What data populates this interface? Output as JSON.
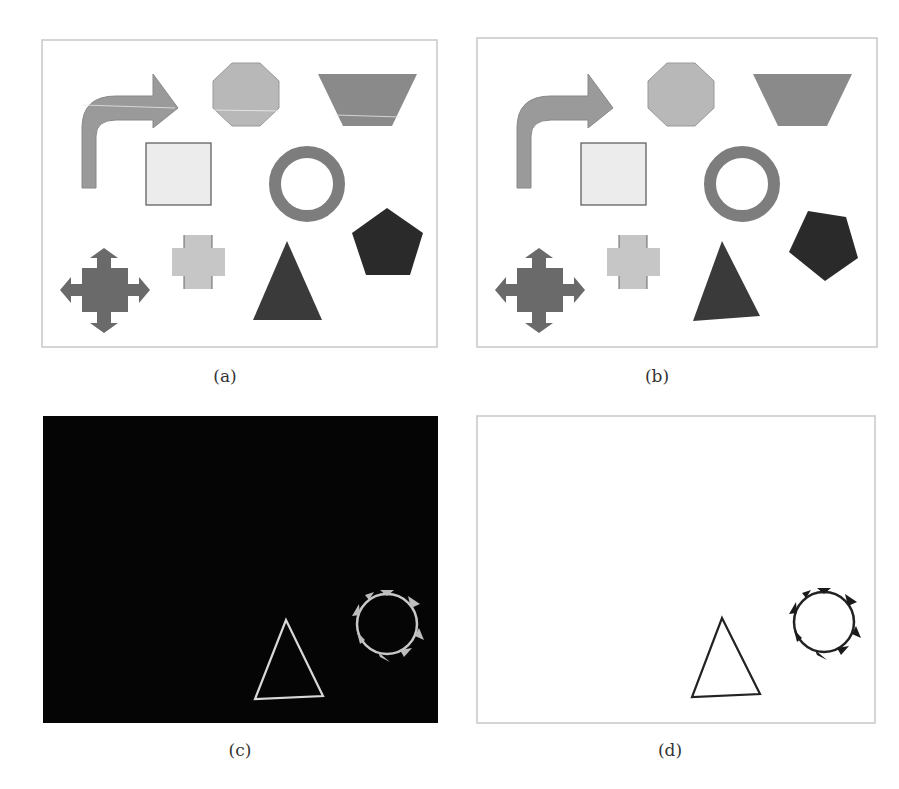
{
  "figure": {
    "panels": [
      {
        "id": "a",
        "label": "(a)",
        "description": "original shapes",
        "background": "#ffffff",
        "border": "#c8c8c8"
      },
      {
        "id": "b",
        "label": "(b)",
        "description": "shapes with triangle and pentagon rotated",
        "background": "#ffffff",
        "border": "#c8c8c8"
      },
      {
        "id": "c",
        "label": "(c)",
        "description": "difference image (white on black)",
        "background": "#050505",
        "border": "#050505"
      },
      {
        "id": "d",
        "label": "(d)",
        "description": "inverted difference image (black on white)",
        "background": "#ffffff",
        "border": "#c8c8c8"
      }
    ],
    "shapes": [
      {
        "name": "curved-arrow",
        "color": "#9a9a9a"
      },
      {
        "name": "octagon",
        "color": "#b8b8b8"
      },
      {
        "name": "trapezoid",
        "color": "#8a8a8a"
      },
      {
        "name": "square",
        "color": "#ececec"
      },
      {
        "name": "ring",
        "color": "#7d7d7d"
      },
      {
        "name": "pentagon",
        "color": "#2a2a2a"
      },
      {
        "name": "four-way-arrow",
        "color": "#6a6a6a"
      },
      {
        "name": "plus-cross",
        "color": "#c6c6c6"
      },
      {
        "name": "triangle",
        "color": "#3a3a3a"
      }
    ],
    "caption_fragment": ""
  }
}
